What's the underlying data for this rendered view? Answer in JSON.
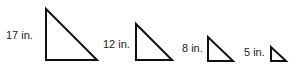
{
  "figure": {
    "triangles": [
      {
        "label": "17 in.",
        "leg_x": 46,
        "top_y": 9,
        "bottom_y": 60,
        "right_x": 97
      },
      {
        "label": "12 in.",
        "leg_x": 136,
        "top_y": 24,
        "bottom_y": 60,
        "right_x": 172
      },
      {
        "label": "8 in.",
        "leg_x": 208,
        "top_y": 37,
        "bottom_y": 61,
        "right_x": 233
      },
      {
        "label": "5 in.",
        "leg_x": 271,
        "top_y": 47,
        "bottom_y": 61,
        "right_x": 286
      }
    ],
    "stroke_color": "#111111"
  }
}
